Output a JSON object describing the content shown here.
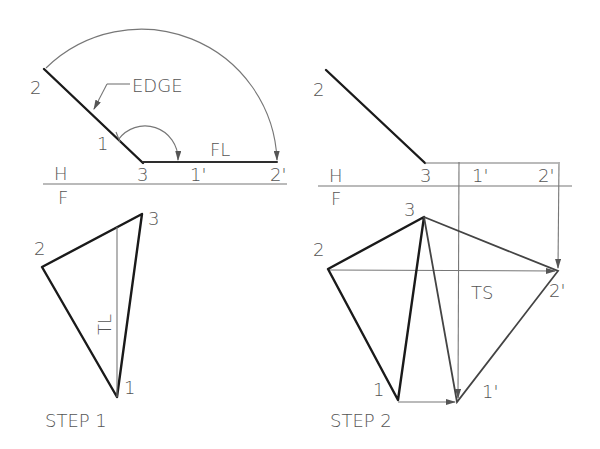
{
  "figure": {
    "panels": [
      {
        "id": "step1",
        "caption": "STEP 1",
        "top_view": {
          "labels": {
            "point2": "2",
            "point1": "1",
            "point3": "3",
            "point1p": "1'",
            "point2p": "2'",
            "edge": "EDGE",
            "fl": "FL"
          }
        },
        "fold_line": {
          "h": "H",
          "f": "F"
        },
        "front_view": {
          "labels": {
            "point2": "2",
            "point3": "3",
            "point1": "1",
            "tl": "TL"
          }
        }
      },
      {
        "id": "step2",
        "caption": "STEP 2",
        "top_view": {
          "labels": {
            "point2": "2",
            "point3": "3",
            "point1p": "1'",
            "point2p": "2'"
          }
        },
        "fold_line": {
          "h": "H",
          "f": "F"
        },
        "front_view": {
          "labels": {
            "point2": "2",
            "point3": "3",
            "point1": "1",
            "point1p": "1'",
            "point2p": "2'",
            "ts": "TS"
          }
        }
      }
    ]
  }
}
